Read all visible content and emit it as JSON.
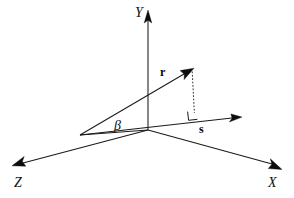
{
  "figure": {
    "kind": "3d-vector-diagram",
    "width": 294,
    "height": 198,
    "background_color": "#ffffff",
    "stroke_color": "#1a1a1a"
  },
  "axes": {
    "y": {
      "label": "Y",
      "direction": "up",
      "origin": [
        148,
        130
      ],
      "tip": [
        148,
        12
      ]
    },
    "x": {
      "label": "X",
      "direction": "down-right",
      "origin": [
        148,
        130
      ],
      "tip": [
        281,
        168
      ]
    },
    "z": {
      "label": "Z",
      "direction": "down-left",
      "origin": [
        148,
        130
      ],
      "tip": [
        13,
        166
      ]
    }
  },
  "vectors": {
    "r": {
      "label": "r",
      "bold": true,
      "tail": [
        80,
        135
      ],
      "tip": [
        193,
        69
      ]
    },
    "s": {
      "label": "s",
      "bold": true,
      "tail": [
        80,
        135
      ],
      "tip": [
        241,
        118
      ]
    }
  },
  "angle": {
    "label": "β",
    "name": "beta",
    "vertex": [
      80,
      135
    ],
    "between": [
      "r",
      "s"
    ]
  },
  "annotations": {
    "projection_line": {
      "name": "dashed-projection",
      "style": "dashed",
      "from": [
        193,
        72
      ],
      "to": [
        194,
        113
      ]
    },
    "right_angle_marker": {
      "name": "right-angle",
      "at": [
        194,
        113
      ],
      "size": 8
    }
  }
}
